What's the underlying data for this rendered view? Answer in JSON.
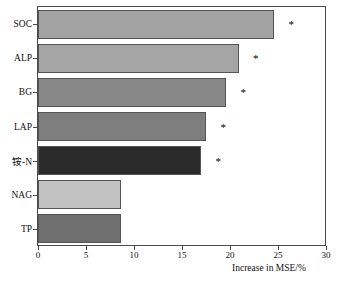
{
  "chart_data": {
    "type": "bar",
    "orientation": "horizontal",
    "title": "",
    "subtitle": "",
    "xlabel": "Increase in MSE/%",
    "ylabel": "",
    "categories": [
      "SOC",
      "ALP",
      "BG",
      "LAP",
      "铵-N",
      "NAG",
      "TP"
    ],
    "values": [
      24.6,
      20.9,
      19.6,
      17.5,
      17.0,
      8.6,
      8.6
    ],
    "bar_colors": [
      "#a3a3a3",
      "#a5a5a5",
      "#878787",
      "#7e7e7e",
      "#2b2b2b",
      "#c2c2c2",
      "#6f6f6f"
    ],
    "annotations": [
      {
        "category": "SOC",
        "text": "*",
        "value": 26.1
      },
      {
        "category": "ALP",
        "text": "*",
        "value": 22.4
      },
      {
        "category": "BG",
        "text": "*",
        "value": 21.1
      },
      {
        "category": "LAP",
        "text": "*",
        "value": 19.0
      },
      {
        "category": "铵-N",
        "text": "*",
        "value": 18.5
      }
    ],
    "xlim": [
      0,
      30
    ],
    "xticks": [
      0,
      5,
      10,
      15,
      20,
      25,
      30
    ],
    "xtick_labels": [
      "0",
      "5",
      "10",
      "15",
      "20",
      "25",
      "30"
    ],
    "grid": false,
    "legend": null,
    "frame": true
  }
}
